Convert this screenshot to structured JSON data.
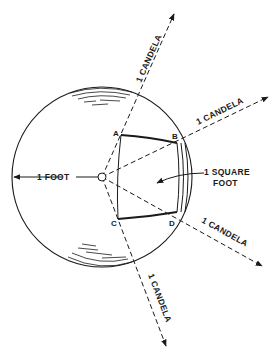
{
  "diagram": {
    "colors": {
      "ink": "#1a1a1a",
      "background": "#ffffff"
    },
    "labels": {
      "ray_up": "1 CANDELA",
      "ray_right_upper": "1 CANDELA",
      "ray_right_lower": "1 CANDELA",
      "ray_down": "1 CANDELA",
      "radius": "1 FOOT",
      "area_line1": "1 SQUARE",
      "area_line2": "FOOT",
      "point_a": "A",
      "point_b": "B",
      "point_c": "C",
      "point_d": "D"
    }
  }
}
